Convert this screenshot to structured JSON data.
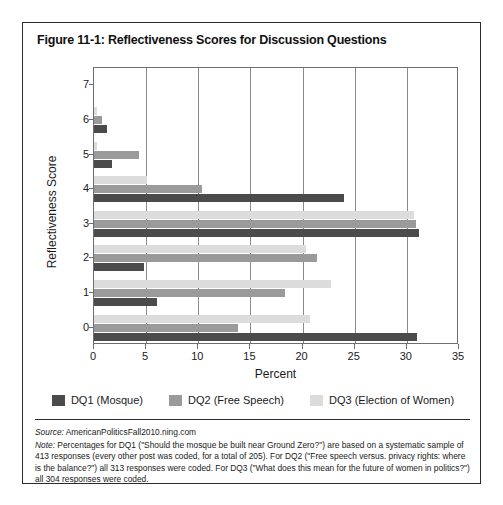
{
  "figure": {
    "title": "Figure 11-1: Reflectiveness Scores for Discussion Questions"
  },
  "chart_data": {
    "type": "bar",
    "orientation": "horizontal",
    "title": "Figure 11-1: Reflectiveness Scores for Discussion Questions",
    "xlabel": "Percent",
    "ylabel": "Reflectiveness Score",
    "xlim": [
      0,
      35
    ],
    "xticks": [
      0,
      5,
      10,
      15,
      20,
      25,
      30,
      35
    ],
    "categories": [
      "0",
      "1",
      "2",
      "3",
      "4",
      "5",
      "6",
      "7"
    ],
    "yticks": [
      "0",
      "1",
      "2",
      "3",
      "4",
      "5",
      "6",
      "7"
    ],
    "grid": "vertical",
    "legend_position": "bottom",
    "series": [
      {
        "name": "DQ1 (Mosque)",
        "color": "#4b4b4b",
        "values": [
          31.0,
          6.0,
          4.8,
          31.2,
          24.0,
          1.7,
          1.2,
          0
        ]
      },
      {
        "name": "DQ2 (Free Speech)",
        "color": "#9a9a9a",
        "values": [
          13.8,
          18.3,
          21.4,
          30.9,
          10.4,
          4.3,
          0.8,
          0
        ]
      },
      {
        "name": "DQ3 (Election of Women)",
        "color": "#dcdcdc",
        "values": [
          20.7,
          22.7,
          20.3,
          30.7,
          5.1,
          0.3,
          0.3,
          0
        ]
      }
    ]
  },
  "footer": {
    "source_label": "Source:",
    "source_text": " AmericanPoliticsFall2010.ning.com",
    "note_label": "Note:",
    "note_text": " Percentages for DQ1 (\"Should the mosque be built near Ground Zero?\") are based on a systematic sample of 413 responses (every other post was coded, for a total of 205). For DQ2 (\"Free speech versus. privacy rights: where is the balance?\") all 313 responses were coded. For DQ3 (\"What does this mean for the future of women in politics?\") all 304 responses were coded."
  }
}
